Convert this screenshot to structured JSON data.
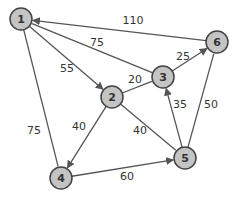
{
  "graph": {
    "type": "directed-weighted-graph",
    "nodes": [
      {
        "id": "1",
        "label": "1"
      },
      {
        "id": "2",
        "label": "2"
      },
      {
        "id": "3",
        "label": "3"
      },
      {
        "id": "4",
        "label": "4"
      },
      {
        "id": "5",
        "label": "5"
      },
      {
        "id": "6",
        "label": "6"
      }
    ],
    "edges": [
      {
        "from": "6",
        "to": "1",
        "weight": "110",
        "directed": true
      },
      {
        "from": "3",
        "to": "1",
        "weight": "75",
        "directed": false
      },
      {
        "from": "1",
        "to": "2",
        "weight": "55",
        "directed": true
      },
      {
        "from": "1",
        "to": "4",
        "weight": "75",
        "directed": false
      },
      {
        "from": "2",
        "to": "3",
        "weight": "20",
        "directed": false
      },
      {
        "from": "3",
        "to": "6",
        "weight": "25",
        "directed": true
      },
      {
        "from": "2",
        "to": "4",
        "weight": "40",
        "directed": true
      },
      {
        "from": "2",
        "to": "5",
        "weight": "40",
        "directed": false
      },
      {
        "from": "5",
        "to": "3",
        "weight": "35",
        "directed": true
      },
      {
        "from": "5",
        "to": "6",
        "weight": "50",
        "directed": false
      },
      {
        "from": "4",
        "to": "5",
        "weight": "60",
        "directed": true
      }
    ]
  }
}
